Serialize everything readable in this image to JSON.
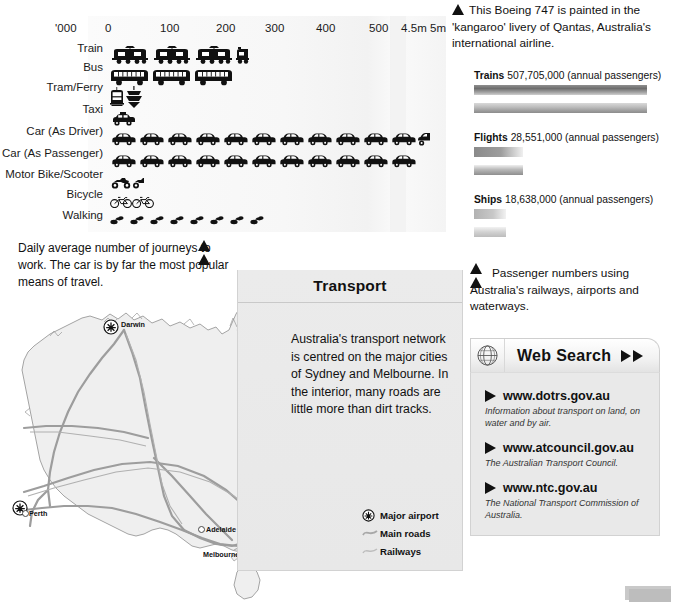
{
  "pictogram_chart": {
    "unit_label": "'000",
    "axis_ticks": [
      "0",
      "100",
      "200",
      "300",
      "400",
      "500",
      "4.5m",
      "5m"
    ],
    "rows": [
      {
        "label": "Train",
        "icon": "train-icon",
        "count": 3,
        "partial": 0.35
      },
      {
        "label": "Bus",
        "icon": "bus-icon",
        "count": 3,
        "partial": 0
      },
      {
        "label": "Tram/Ferry",
        "icon": "tram-ferry-icon",
        "count": 1,
        "partial": 0
      },
      {
        "label": "Taxi",
        "icon": "taxi-icon",
        "count": 1,
        "partial": 0
      },
      {
        "label": "Car (As Driver)",
        "icon": "car-icon",
        "count": 11,
        "partial": 0.4
      },
      {
        "label": "Car (As Passenger)",
        "icon": "car-icon",
        "count": 11,
        "partial": 0
      },
      {
        "label": "Motor Bike/Scooter",
        "icon": "motorbike-icon",
        "count": 1,
        "partial": 0.4
      },
      {
        "label": "Bicycle",
        "icon": "bicycle-icon",
        "count": 2,
        "partial": 0
      },
      {
        "label": "Walking",
        "icon": "walking-icon",
        "count": 8,
        "partial": 0
      }
    ]
  },
  "chart_data": {
    "type": "bar",
    "title": "Daily average number of journeys to work",
    "xlabel": "'000",
    "ylabel": "",
    "categories": [
      "Train",
      "Bus",
      "Tram/Ferry",
      "Taxi",
      "Car (As Driver)",
      "Car (As Passenger)",
      "Motor Bike/Scooter",
      "Bicycle",
      "Walking"
    ],
    "values": [
      230,
      215,
      45,
      30,
      510,
      500,
      35,
      55,
      205
    ],
    "xlim": [
      0,
      540
    ],
    "tick_labels": [
      "0",
      "100",
      "200",
      "300",
      "400",
      "500",
      "4.5m",
      "5m"
    ],
    "grid": false,
    "legend": "none",
    "note": "Pictogram — each icon represents approximately 70,000 journeys"
  },
  "captions": {
    "daily": "Daily average number of journeys to work. The car is by far the most popular means of travel.",
    "boeing": "This Boeing 747 is painted in the 'kangaroo' livery of Qantas, Australia's international airline.",
    "passengers": "Passenger numbers using Australia's railways, airports and waterways."
  },
  "gradient_bars": {
    "items": [
      {
        "name": "Trains",
        "value": "507,705,000",
        "unit": "(annual passengers)",
        "width_pct": 100
      },
      {
        "name": "Flights",
        "value": "28,551,000",
        "unit": "(annual passengers)",
        "width_pct": 28
      },
      {
        "name": "Ships",
        "value": "18,638,000",
        "unit": "(annual passengers)",
        "width_pct": 18
      }
    ]
  },
  "transport_panel": {
    "title": "Transport",
    "body": "Australia's transport network is centred on the major cities of Sydney and Melbourne. In the interior, many roads are little more than dirt tracks."
  },
  "map": {
    "cities": [
      {
        "name": "Darwin",
        "x": 125,
        "y": 325,
        "airport": true,
        "label_dx": 8,
        "label_dy": -4
      },
      {
        "name": "Perth",
        "x": 24,
        "y": 509,
        "airport": true,
        "label_dx": 8,
        "label_dy": 1
      },
      {
        "name": "Adelaide",
        "x": 200,
        "y": 527,
        "airport": false,
        "label_dx": 7,
        "label_dy": -1
      },
      {
        "name": "Melbourne",
        "x": 250,
        "y": 552,
        "airport": true,
        "label_dx": -46,
        "label_dy": -1
      },
      {
        "name": "Canberra",
        "x": 277,
        "y": 530,
        "airport": false,
        "label_dx": -14,
        "label_dy": 5
      },
      {
        "name": "Sydney",
        "x": 293,
        "y": 521,
        "airport": true,
        "label_dx": 8,
        "label_dy": 1
      },
      {
        "name": "Brisbane",
        "x": 297,
        "y": 462,
        "airport": true,
        "label_dx": -33,
        "label_dy": 3
      }
    ],
    "legend": [
      {
        "icon": "airport-icon",
        "label": "Major airport"
      },
      {
        "icon": "road-line-icon",
        "label": "Main roads"
      },
      {
        "icon": "rail-line-icon",
        "label": "Railways"
      }
    ]
  },
  "web_search": {
    "title": "Web Search",
    "icon": "globe-icon",
    "items": [
      {
        "url": "www.dotrs.gov.au",
        "desc": "Information about transport on land, on water and by air."
      },
      {
        "url": "www.atcouncil.gov.au",
        "desc": "The Australian Transport Council."
      },
      {
        "url": "www.ntc.gov.au",
        "desc": "The National Transport Commission of Australia."
      }
    ]
  },
  "colors": {
    "page_background": "#ffffff",
    "panel_background": "#e9e9e9",
    "map_land": "#efefef",
    "map_line": "#8f8f8f",
    "text": "#111111"
  }
}
